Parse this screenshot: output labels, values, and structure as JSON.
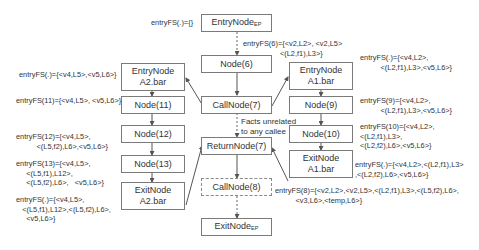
{
  "nodes": {
    "entry_ep": {
      "label": "EntryNode",
      "sub": "EP"
    },
    "node6": {
      "label": "Node(6)"
    },
    "callnode7": {
      "label": "CallNode(7)"
    },
    "returnnode7": {
      "label": "ReturnNode(7)"
    },
    "callnode8": {
      "label": "CallNode(8)"
    },
    "exit_ep": {
      "label": "ExitNode",
      "sub": "EP"
    },
    "entry_a2": {
      "line1": "EntryNode",
      "line2": "A2.bar"
    },
    "node11": {
      "label": "Node(11)"
    },
    "node12": {
      "label": "Node(12)"
    },
    "node13": {
      "label": "Node(13)"
    },
    "exit_a2": {
      "line1": "ExitNode",
      "line2": "A2.bar"
    },
    "entry_a1": {
      "line1": "EntryNode",
      "line2": "A1.bar"
    },
    "node9": {
      "label": "Node(9)"
    },
    "node10": {
      "label": "Node(10)"
    },
    "exit_a1": {
      "line1": "ExitNode",
      "line2": "A1.bar"
    }
  },
  "annotations": {
    "entry_ep": "entryFS(.)={}",
    "node6": "entryFS(6)={<v2,L2>, <v2,L5>\n                  <(L2,f1),L3>}",
    "entry_a2": "entryFS(.)={<v4,L5>,<v5,L6>}",
    "node11": "entryFS(11)={<v4,L5>, <v5,L6>}",
    "node12": "entryFS(12)={<v4,L5>,\n          <(L5,f2),L6>,<v5,L6>}",
    "node13": "entryFS(13)={<v4,L5>,\n     <(L5,f1),L12>,\n     <(L5,f2),L6>,   <v5,L6>}",
    "exit_a2": "entryFS(.)={<v4,L5>,\n   <(L5,f1),L12>,<(L5,f2),L6>,\n     <v5,L6>}",
    "entry_a1": "entryFS(.)={<v4,L2>,\n          <(L2,f1),L3>,<v5,L6>}",
    "node9": "entryFS(9)={<v4,L2>,\n          <(L2,f1),L3>,<v5,L6>}",
    "node10": "entryFS(10)={<v4,L2>,\n<(L2,f1),L3>,\n<(L2,f2),L6>,<v5,L6>}",
    "exit_a1": "entryFS(.)={<v4,L2>,<(L2,f1),L3>\n,<(L2,f2),L6>,<v5,L6>}",
    "callnode8": "entryFS(8)={<v2,L2>,<v2,L5>,<(L2,f1),L3>,<(L5,f2),L6>,\n          <v3,L6>,<temp,L6>}",
    "unrelated": "Facts unrelated\nto any callee"
  }
}
